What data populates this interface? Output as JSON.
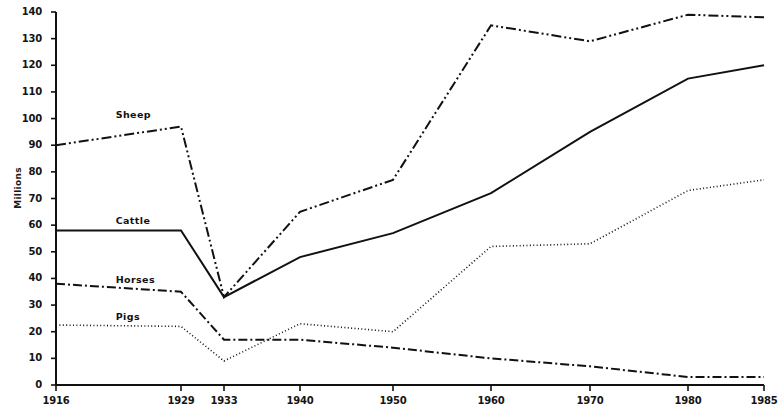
{
  "chart_data": {
    "type": "line",
    "title": "",
    "subtitle": "",
    "xlabel": "",
    "ylabel": "Millions",
    "x": [
      1916,
      1929,
      1933,
      1940,
      1950,
      1960,
      1970,
      1980,
      1985
    ],
    "xtick_labels": [
      "1916",
      "1929",
      "1933",
      "1940",
      "1950",
      "1960",
      "1970",
      "1980",
      "1985"
    ],
    "ytick_labels": [
      "0",
      "10",
      "20",
      "30",
      "40",
      "50",
      "60",
      "70",
      "80",
      "90",
      "100",
      "110",
      "120",
      "130",
      "140"
    ],
    "ytick_values": [
      0,
      10,
      20,
      30,
      40,
      50,
      60,
      70,
      80,
      90,
      100,
      110,
      120,
      130,
      140
    ],
    "xlim": [
      1916,
      1985
    ],
    "ylim": [
      0,
      140
    ],
    "grid": false,
    "legend": "inline-labels",
    "series": [
      {
        "name": "Sheep",
        "style": "dash-dot-dot",
        "color": "#111111",
        "values": [
          90,
          97,
          33,
          65,
          77,
          135,
          129,
          139,
          138
        ],
        "label_x": 1922,
        "label_y": 101
      },
      {
        "name": "Cattle",
        "style": "solid",
        "color": "#111111",
        "values": [
          58,
          58,
          33,
          48,
          57,
          72,
          95,
          115,
          120
        ],
        "label_x": 1922,
        "label_y": 61
      },
      {
        "name": "Horses",
        "style": "dash-dot",
        "color": "#111111",
        "values": [
          38,
          35,
          17,
          17,
          14,
          10,
          7,
          3,
          3
        ],
        "label_x": 1922,
        "label_y": 39
      },
      {
        "name": "Pigs",
        "style": "dotted",
        "color": "#111111",
        "values": [
          22.5,
          22,
          9,
          23,
          20,
          52,
          53,
          73,
          77
        ],
        "label_x": 1922,
        "label_y": 25
      }
    ]
  }
}
